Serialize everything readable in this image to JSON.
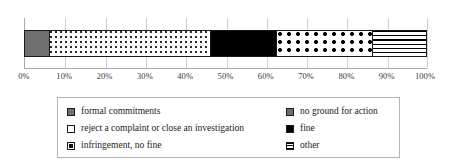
{
  "chart_data": {
    "type": "bar",
    "orientation": "horizontal",
    "stacked": true,
    "normalized": "100%",
    "title": "",
    "xlabel": "",
    "ylabel": "",
    "xlim": [
      0,
      100
    ],
    "grid": true,
    "legend_position": "bottom",
    "categories": [
      ""
    ],
    "axis": {
      "ticks": [
        0,
        10,
        20,
        30,
        40,
        50,
        60,
        70,
        80,
        90,
        100
      ],
      "tick_labels": [
        "0%",
        "10%",
        "20%",
        "30%",
        "40%",
        "50%",
        "60%",
        "70%",
        "80%",
        "90%",
        "100%"
      ]
    },
    "series": [
      {
        "name": "no ground for action",
        "values": [
          6.7
        ],
        "pattern": "solid-gray",
        "color": "#6e6e6e"
      },
      {
        "name": "reject a complaint or close an investigation",
        "values": [
          42.7
        ],
        "pattern": "sparse-dots",
        "color": "#ffffff"
      },
      {
        "name": "fine",
        "values": [
          17.5
        ],
        "pattern": "solid-black",
        "color": "#000000"
      },
      {
        "name": "infringement, no fine",
        "values": [
          25.6
        ],
        "pattern": "big-dots",
        "color": "#ffffff"
      },
      {
        "name": "other",
        "values": [
          14.5
        ],
        "pattern": "h-lines",
        "color": "#ffffff"
      }
    ]
  },
  "legend": {
    "left_column": [
      {
        "label": "formal commitments",
        "pattern": "solid-gray"
      },
      {
        "label": "reject a complaint or close an investigation",
        "pattern": "white"
      },
      {
        "label": "infringement, no fine",
        "pattern": "big-dots"
      }
    ],
    "right_column": [
      {
        "label": "no ground for action",
        "pattern": "solid-gray"
      },
      {
        "label": "fine",
        "pattern": "solid-black"
      },
      {
        "label": "other",
        "pattern": "h-lines"
      }
    ]
  }
}
